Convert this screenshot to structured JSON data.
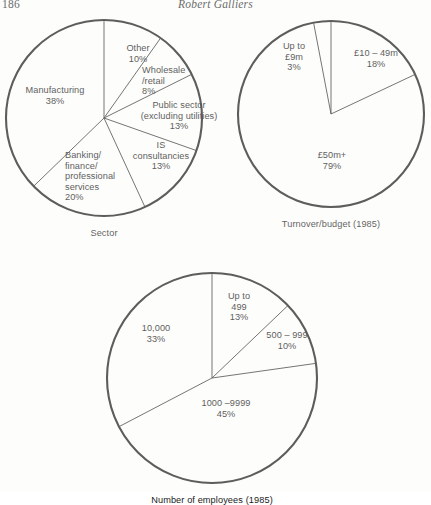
{
  "page": {
    "folio": "186",
    "running_head": "Robert Galliers"
  },
  "chart_data": [
    {
      "type": "pie",
      "id": "sector",
      "title": "Sector",
      "caption": "Sector",
      "start_angle_deg": 0,
      "direction": "clockwise",
      "center": {
        "x": 104,
        "y": 118
      },
      "radius": 98,
      "labels": [
        "Other",
        "Wholesale/retail",
        "Public sector (excluding utilities)",
        "IS consultancies",
        "Banking/finance/professional services",
        "Manufacturing"
      ],
      "values": [
        10,
        8,
        13,
        13,
        20,
        38
      ],
      "slices": [
        {
          "name": "Other",
          "text": "Other",
          "percent_text": "10%",
          "value": 10,
          "lines": [
            "Other",
            "10%"
          ],
          "label_x": 108,
          "label_y": 43,
          "align": "center",
          "width": 60
        },
        {
          "name": "Wholesale/retail",
          "text": "Wholesale/retail",
          "percent_text": "8%",
          "value": 8,
          "lines": [
            "Wholesale",
            "/retail",
            "8%"
          ],
          "label_x": 142,
          "label_y": 65,
          "align": "left",
          "width": 60
        },
        {
          "name": "Public sector (excluding utilities)",
          "text": "Public sector (excluding utilities)",
          "percent_text": "13%",
          "value": 13,
          "lines": [
            "Public sector",
            "(excluding utilities)",
            "13%"
          ],
          "label_x": 131,
          "label_y": 100,
          "align": "center",
          "width": 96
        },
        {
          "name": "IS consultancies",
          "text": "IS consultancies",
          "percent_text": "13%",
          "value": 13,
          "lines": [
            "IS",
            "consultancies",
            "13%"
          ],
          "label_x": 126,
          "label_y": 140,
          "align": "center",
          "width": 70
        },
        {
          "name": "Banking/finance/professional services",
          "text": "Banking/finance/professional services",
          "percent_text": "20%",
          "value": 20,
          "lines": [
            "Banking/",
            "finance/",
            "professional",
            "services",
            "20%"
          ],
          "label_x": 65,
          "label_y": 150,
          "align": "left",
          "width": 72
        },
        {
          "name": "Manufacturing",
          "text": "Manufacturing",
          "percent_text": "38%",
          "value": 38,
          "lines": [
            "Manufacturing",
            "38%"
          ],
          "label_x": 18,
          "label_y": 85,
          "align": "center",
          "width": 74
        }
      ]
    },
    {
      "type": "pie",
      "id": "turnover-budget",
      "title": "Turnover/budget (1985)",
      "caption": "Turnover/budget (1985)",
      "start_angle_deg": 0,
      "direction": "clockwise",
      "center": {
        "x": 331,
        "y": 114
      },
      "radius": 93,
      "labels": [
        "£10 – 49m",
        "£50m+",
        "Up to £9m"
      ],
      "values": [
        18,
        79,
        3
      ],
      "slices": [
        {
          "name": "£10 – 49m",
          "text": "£10 – 49m",
          "percent_text": "18%",
          "value": 18,
          "lines": [
            "£10 – 49m",
            "18%"
          ],
          "label_x": 343,
          "label_y": 48,
          "align": "center",
          "width": 66
        },
        {
          "name": "£50m+",
          "text": "£50m+",
          "percent_text": "79%",
          "value": 79,
          "lines": [
            "£50m+",
            "79%"
          ],
          "label_x": 305,
          "label_y": 150,
          "align": "center",
          "width": 54
        },
        {
          "name": "Up to £9m",
          "text": "Up to £9m",
          "percent_text": "3%",
          "value": 3,
          "lines": [
            "Up to",
            "£9m",
            "3%"
          ],
          "label_x": 272,
          "label_y": 41,
          "align": "center",
          "width": 44
        }
      ]
    },
    {
      "type": "pie",
      "id": "number-of-employees",
      "title": "Number of employees (1985)",
      "caption": "Number of employees (1985)",
      "start_angle_deg": 0,
      "direction": "clockwise",
      "center": {
        "x": 212,
        "y": 378
      },
      "radius": 105,
      "labels": [
        "Up to 499",
        "500 – 999",
        "1000 –9999",
        "10,000"
      ],
      "values": [
        13,
        10,
        45,
        33
      ],
      "slices": [
        {
          "name": "Up to 499",
          "text": "Up to 499",
          "percent_text": "13%",
          "value": 13,
          "lines": [
            "Up to",
            "499",
            "13%"
          ],
          "label_x": 218,
          "label_y": 291,
          "align": "center",
          "width": 42
        },
        {
          "name": "500 – 999",
          "text": "500 – 999",
          "percent_text": "10%",
          "value": 10,
          "lines": [
            "500 – 999",
            "10%"
          ],
          "label_x": 258,
          "label_y": 330,
          "align": "center",
          "width": 58
        },
        {
          "name": "1000 –9999",
          "text": "1000 –9999",
          "percent_text": "45%",
          "value": 45,
          "lines": [
            "1000 –9999",
            "45%"
          ],
          "label_x": 191,
          "label_y": 398,
          "align": "center",
          "width": 70
        },
        {
          "name": "10,000",
          "text": "10,000",
          "percent_text": "33%",
          "value": 33,
          "lines": [
            "10,000",
            "33%"
          ],
          "label_x": 132,
          "label_y": 323,
          "align": "center",
          "width": 48
        }
      ]
    }
  ],
  "style": {
    "stroke_color": "#1a1a1a",
    "fill_color": "#ffffff",
    "outline_width": 2.1,
    "spoke_width": 0.85,
    "background": "#ffffff"
  }
}
